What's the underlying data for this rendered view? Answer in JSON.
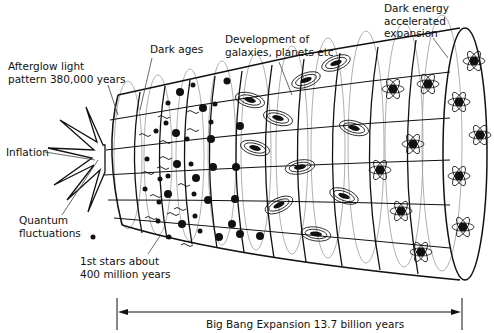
{
  "diagram": {
    "title": "Big Bang Expansion",
    "labels": {
      "afterglow": "Afterglow light\npattern 380,000 years",
      "inflation": "Inflation",
      "quantum": "Quantum\nfluctuations",
      "dark_ages": "Dark ages",
      "development": "Development of\ngalaxies, planets etc",
      "dark_energy": "Dark energy\naccelerated\nexpansion",
      "first_stars": "1st stars about\n400 million years",
      "timeline": "Big Bang Expansion 13.7 billion years"
    },
    "colors": {
      "line": "#111111",
      "grid_faint": "#9a9a9a",
      "background": "#ffffff"
    }
  }
}
